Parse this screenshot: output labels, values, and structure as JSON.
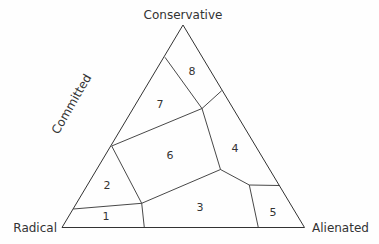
{
  "diagram": {
    "type": "ternary-diagram",
    "vertices": {
      "top": "Conservative",
      "left": "Radical",
      "right": "Alienated"
    },
    "side_label": "Committed",
    "regions": [
      {
        "id": "1",
        "label": "1"
      },
      {
        "id": "2",
        "label": "2"
      },
      {
        "id": "3",
        "label": "3"
      },
      {
        "id": "4",
        "label": "4"
      },
      {
        "id": "5",
        "label": "5"
      },
      {
        "id": "6",
        "label": "6"
      },
      {
        "id": "7",
        "label": "7"
      },
      {
        "id": "8",
        "label": "8"
      }
    ],
    "line_color": "#333333",
    "background": "#fefefe"
  }
}
